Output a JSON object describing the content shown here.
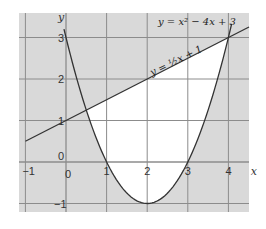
{
  "chart_data": {
    "type": "line",
    "title": "",
    "xlabel": "x",
    "ylabel": "y",
    "xlim": [
      -1.15,
      4.5
    ],
    "ylim": [
      -1.2,
      3.6
    ],
    "grid": true,
    "x_ticks": [
      "-1",
      "0",
      "1",
      "2",
      "3",
      "4"
    ],
    "y_ticks": [
      "-1",
      "0",
      "1",
      "2",
      "3"
    ],
    "origin_label": "0",
    "series": [
      {
        "name": "y = x² − 4x + 3",
        "label_text": "y = x² − 4x + 3",
        "kind": "parabola",
        "coefficients": {
          "a": 1,
          "b": -4,
          "c": 3
        },
        "x": [
          0,
          0.5,
          1,
          1.5,
          2,
          2.5,
          3,
          3.5,
          4
        ],
        "values": [
          3,
          1.25,
          0,
          -0.75,
          -1,
          -0.75,
          0,
          1.25,
          3
        ]
      },
      {
        "name": "y = ½x + 1",
        "label_text": "y = ½x + 1",
        "kind": "line",
        "coefficients": {
          "m": 0.5,
          "c": 1
        },
        "x": [
          -1,
          0,
          1,
          2,
          3,
          4,
          4.5
        ],
        "values": [
          0.5,
          1,
          1.5,
          2,
          2.5,
          3,
          3.25
        ]
      }
    ],
    "shaded_region": "area between line and parabola unshaded (white); rest of grid shaded grey",
    "intersections": [
      [
        0.5,
        1.25
      ],
      [
        4,
        3
      ]
    ]
  },
  "colors": {
    "background": "#d9d9d9",
    "region": "#ffffff",
    "grid": "#8c8c8c",
    "curve": "#333333"
  }
}
